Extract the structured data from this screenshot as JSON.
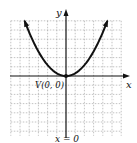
{
  "chart_data": {
    "type": "line",
    "title": "",
    "xlabel": "x",
    "ylabel": "y",
    "function": "y = x^2",
    "vertex": {
      "label": "V(0, 0)",
      "x": 0,
      "y": 0
    },
    "axis_of_symmetry": {
      "label": "x = 0"
    },
    "grid": true,
    "xlim": [
      -6,
      6
    ],
    "ylim": [
      -6,
      6
    ],
    "series": [
      {
        "name": "parabola",
        "x": [
          -2.5,
          -2,
          -1.5,
          -1,
          -0.5,
          0,
          0.5,
          1,
          1.5,
          2,
          2.5
        ],
        "y": [
          6.25,
          4,
          2.25,
          1,
          0.25,
          0,
          0.25,
          1,
          2.25,
          4,
          6.25
        ]
      }
    ]
  },
  "labels": {
    "x_axis": "x",
    "y_axis": "y",
    "vertex": "V(0, 0)",
    "symmetry": "x = 0"
  },
  "colors": {
    "curve": "#111111",
    "axis": "#111111",
    "grid": "#9a9a9a"
  }
}
